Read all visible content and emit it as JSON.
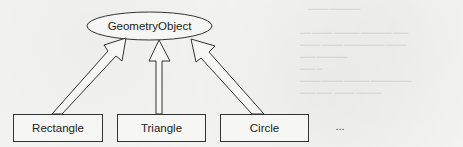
{
  "diagram": {
    "type": "class-inheritance",
    "parent": {
      "label": "GeometryObject",
      "shape": "ellipse"
    },
    "children": [
      {
        "label": "Rectangle",
        "shape": "rectangle"
      },
      {
        "label": "Triangle",
        "shape": "rectangle"
      },
      {
        "label": "Circle",
        "shape": "rectangle"
      }
    ],
    "more_indicator": "...",
    "edges": [
      {
        "from": "Rectangle",
        "to": "GeometryObject",
        "style": "hollow-block-arrow"
      },
      {
        "from": "Triangle",
        "to": "GeometryObject",
        "style": "hollow-block-arrow"
      },
      {
        "from": "Circle",
        "to": "GeometryObject",
        "style": "hollow-block-arrow"
      }
    ]
  },
  "colors": {
    "background": "#f3f3f1",
    "stroke": "#333333",
    "text": "#222222"
  }
}
